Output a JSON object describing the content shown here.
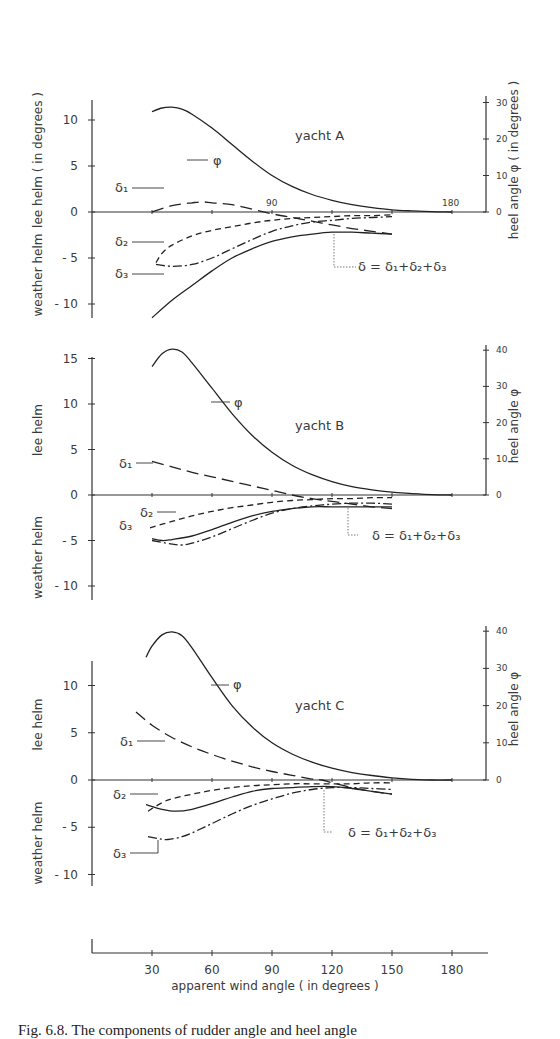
{
  "caption": "Fig. 6.8. The components of rudder angle and heel angle",
  "chart_data": {
    "type": "line",
    "xlabel": "apparent  wind  angle  ( in degrees )",
    "xticks": [
      30,
      60,
      90,
      120,
      150,
      180
    ],
    "xlim": [
      0,
      195
    ],
    "left_axis_label_top": "lee helm",
    "left_axis_label_bottom": "weather helm",
    "left_axis_units": "( in degrees )",
    "right_axis_label": "heel  angle  φ",
    "right_axis_units": "( in degrees )",
    "formula": "δ  =  δ₁+δ₂+δ₃",
    "series_styles": {
      "phi": "solid-thin",
      "delta1": "long-dash",
      "delta2": "short-dash",
      "delta3": "dash-dot",
      "delta": "solid"
    },
    "panels": [
      {
        "name": "yacht  A",
        "yticks": [
          10,
          5,
          0,
          -5,
          -10
        ],
        "ylim": [
          -11.5,
          12
        ],
        "rticks": [
          0,
          10,
          20,
          30
        ],
        "rlim": [
          0,
          30
        ],
        "layout": {
          "y0": 212,
          "pxPerUnit": 9.2,
          "yTop": 100,
          "yBot": 318,
          "rPxPerDeg": 3.65,
          "rTop": 96,
          "titleX": 295,
          "titleY": 140
        },
        "series": [
          {
            "name": "φ",
            "key": "phi",
            "axis": "right",
            "x": [
              30,
              35,
              40,
              45,
              50,
              60,
              70,
              80,
              90,
              100,
              110,
              120,
              130,
              140,
              150,
              160,
              170,
              180
            ],
            "values": [
              27.5,
              28.5,
              28.7,
              28.2,
              26.8,
              23.0,
              18.5,
              14.0,
              10.0,
              7.0,
              4.8,
              3.2,
              2.0,
              1.2,
              0.6,
              0.3,
              0.1,
              0.0
            ]
          },
          {
            "name": "δ₁",
            "key": "delta1",
            "axis": "left",
            "x": [
              30,
              40,
              50,
              55,
              60,
              70,
              80,
              90,
              100,
              110,
              120,
              130,
              140,
              150
            ],
            "values": [
              0.0,
              0.7,
              1.0,
              1.1,
              1.0,
              0.8,
              0.3,
              -0.2,
              -0.6,
              -1.0,
              -1.4,
              -1.8,
              -2.1,
              -2.4
            ]
          },
          {
            "name": "δ₂",
            "key": "delta2",
            "axis": "left",
            "x": [
              32,
              35,
              40,
              50,
              60,
              70,
              80,
              90,
              100,
              110,
              120,
              130,
              140,
              150
            ],
            "values": [
              -5.5,
              -4.5,
              -3.6,
              -2.6,
              -2.0,
              -1.6,
              -1.2,
              -0.9,
              -0.7,
              -0.6,
              -0.5,
              -0.4,
              -0.4,
              -0.3
            ]
          },
          {
            "name": "δ₃",
            "key": "delta3",
            "axis": "left",
            "x": [
              32,
              40,
              50,
              60,
              70,
              80,
              90,
              100,
              110,
              120,
              130,
              140,
              150
            ],
            "values": [
              -5.7,
              -5.9,
              -5.7,
              -5.0,
              -4.0,
              -3.0,
              -2.1,
              -1.5,
              -1.1,
              -0.9,
              -0.7,
              -0.6,
              -0.5
            ]
          },
          {
            "name": "δ",
            "key": "delta",
            "axis": "left",
            "x": [
              30,
              40,
              50,
              60,
              70,
              80,
              90,
              100,
              110,
              120,
              130,
              140,
              150
            ],
            "values": [
              -11.5,
              -9.6,
              -8.0,
              -6.4,
              -5.0,
              -4.0,
              -3.2,
              -2.7,
              -2.4,
              -2.2,
              -2.2,
              -2.3,
              -2.4
            ]
          }
        ],
        "labels": [
          {
            "text": "φ",
            "x": 213,
            "y": 165,
            "leader": [
              [
                187,
                160
              ],
              [
                208,
                160
              ]
            ]
          },
          {
            "text": "δ₁",
            "x": 115,
            "y": 192,
            "leader": [
              [
                132,
                188
              ],
              [
                164,
                188
              ]
            ]
          },
          {
            "text": "δ₂",
            "x": 115,
            "y": 246,
            "leader": [
              [
                132,
                242
              ],
              [
                164,
                242
              ]
            ]
          },
          {
            "text": "δ₃",
            "x": 115,
            "y": 278,
            "leader": [
              [
                132,
                274
              ],
              [
                164,
                274
              ]
            ]
          },
          {
            "text": "90",
            "x": 266,
            "y": 206,
            "leader": []
          },
          {
            "text": "180",
            "x": 442,
            "y": 206,
            "leader": []
          }
        ],
        "formula_pos": {
          "x": 338,
          "y": 271,
          "leader": [
            [
              334,
              234
            ],
            [
              334,
              267
            ],
            [
              356,
              267
            ]
          ]
        }
      },
      {
        "name": "yacht  B",
        "yticks": [
          15,
          10,
          5,
          0,
          -5,
          -10
        ],
        "ylim": [
          -11.5,
          15.5
        ],
        "rticks": [
          0,
          10,
          20,
          30,
          40
        ],
        "rlim": [
          0,
          40
        ],
        "layout": {
          "y0": 495,
          "pxPerUnit": 9.1,
          "yTop": 357,
          "yBot": 600,
          "rPxPerDeg": 3.62,
          "rTop": 345,
          "titleX": 295,
          "titleY": 430
        },
        "series": [
          {
            "name": "φ",
            "key": "phi",
            "axis": "right",
            "x": [
              30,
              35,
              40,
              45,
              50,
              60,
              70,
              80,
              90,
              100,
              110,
              120,
              130,
              140,
              150,
              160,
              170,
              180
            ],
            "values": [
              35.5,
              39.0,
              40.3,
              39.5,
              36.5,
              29.5,
              22.5,
              16.5,
              11.8,
              8.2,
              5.6,
              3.7,
              2.3,
              1.4,
              0.8,
              0.4,
              0.1,
              0.0
            ]
          },
          {
            "name": "δ₁",
            "key": "delta1",
            "axis": "left",
            "x": [
              30,
              40,
              50,
              60,
              70,
              80,
              90,
              100,
              110,
              120,
              130,
              140,
              150
            ],
            "values": [
              3.7,
              3.1,
              2.5,
              2.0,
              1.5,
              1.0,
              0.5,
              0.0,
              -0.4,
              -0.7,
              -1.0,
              -1.3,
              -1.5
            ]
          },
          {
            "name": "δ₂",
            "key": "delta2",
            "axis": "left",
            "x": [
              29,
              40,
              50,
              60,
              70,
              80,
              90,
              100,
              110,
              120,
              130,
              140,
              150
            ],
            "values": [
              -3.6,
              -2.9,
              -2.3,
              -1.8,
              -1.4,
              -1.1,
              -0.8,
              -0.6,
              -0.5,
              -0.4,
              -0.4,
              -0.3,
              -0.3
            ]
          },
          {
            "name": "δ₃",
            "key": "delta3",
            "axis": "left",
            "x": [
              30,
              40,
              45,
              50,
              60,
              70,
              80,
              90,
              100,
              110,
              120,
              130,
              140,
              150
            ],
            "values": [
              -5.0,
              -5.4,
              -5.5,
              -5.3,
              -4.6,
              -3.7,
              -2.8,
              -2.0,
              -1.5,
              -1.2,
              -1.0,
              -0.9,
              -0.9,
              -1.0
            ]
          },
          {
            "name": "δ",
            "key": "delta",
            "axis": "left",
            "x": [
              30,
              35,
              40,
              50,
              60,
              70,
              80,
              90,
              100,
              110,
              120,
              130,
              140,
              150
            ],
            "values": [
              -4.8,
              -5.0,
              -4.9,
              -4.5,
              -3.8,
              -3.0,
              -2.3,
              -1.8,
              -1.5,
              -1.3,
              -1.3,
              -1.3,
              -1.3,
              -1.3
            ]
          }
        ],
        "labels": [
          {
            "text": "φ",
            "x": 234,
            "y": 407,
            "leader": [
              [
                211,
                402
              ],
              [
                230,
                402
              ]
            ]
          },
          {
            "text": "δ₁",
            "x": 119,
            "y": 468,
            "leader": [
              [
                136,
                463
              ],
              [
                153,
                463
              ]
            ]
          },
          {
            "text": "δ₂",
            "x": 140,
            "y": 517,
            "leader": [
              [
                157,
                512
              ],
              [
                176,
                512
              ]
            ]
          },
          {
            "text": "δ₃",
            "x": 119,
            "y": 530,
            "leader": []
          }
        ],
        "formula_pos": {
          "x": 352,
          "y": 540,
          "leader": [
            [
              348,
              508
            ],
            [
              348,
              535
            ],
            [
              358,
              535
            ]
          ]
        }
      },
      {
        "name": "yacht  C",
        "yticks": [
          10,
          5,
          0,
          -5,
          -10
        ],
        "ylim": [
          -11,
          12.5
        ],
        "rticks": [
          0,
          10,
          20,
          30,
          40
        ],
        "rlim": [
          0,
          40
        ],
        "layout": {
          "y0": 780,
          "pxPerUnit": 9.45,
          "yTop": 661,
          "yBot": 886,
          "rPxPerDeg": 3.72,
          "rTop": 626,
          "titleX": 295,
          "titleY": 710
        },
        "series": [
          {
            "name": "φ",
            "key": "phi",
            "axis": "right",
            "x": [
              27,
              30,
              35,
              40,
              45,
              50,
              60,
              70,
              80,
              90,
              100,
              110,
              120,
              130,
              140,
              150,
              160,
              170,
              180
            ],
            "values": [
              33.0,
              36.0,
              39.0,
              39.8,
              38.8,
              35.5,
              27.5,
              20.0,
              14.3,
              10.0,
              7.0,
              4.8,
              3.2,
              2.0,
              1.2,
              0.6,
              0.2,
              0.0,
              0.0
            ]
          },
          {
            "name": "δ₁",
            "key": "delta1",
            "axis": "left",
            "x": [
              22,
              30,
              40,
              50,
              60,
              70,
              80,
              90,
              100,
              110,
              115,
              120,
              130,
              140,
              150
            ],
            "values": [
              7.2,
              5.8,
              4.5,
              3.5,
              2.7,
              2.0,
              1.4,
              0.9,
              0.5,
              0.1,
              0.0,
              -0.3,
              -0.8,
              -1.2,
              -1.5
            ]
          },
          {
            "name": "δ₂",
            "key": "delta2",
            "axis": "left",
            "x": [
              28,
              35,
              40,
              50,
              60,
              70,
              80,
              90,
              100,
              110,
              120,
              130,
              140,
              150
            ],
            "values": [
              -3.3,
              -2.4,
              -2.0,
              -1.5,
              -1.1,
              -0.8,
              -0.6,
              -0.5,
              -0.4,
              -0.4,
              -0.4,
              -0.4,
              -0.3,
              -0.3
            ]
          },
          {
            "name": "δ₃",
            "key": "delta3",
            "axis": "left",
            "x": [
              28,
              33,
              38,
              45,
              50,
              60,
              70,
              80,
              90,
              100,
              110,
              120,
              130,
              140,
              150
            ],
            "values": [
              -6.0,
              -6.2,
              -6.3,
              -6.0,
              -5.6,
              -4.6,
              -3.6,
              -2.7,
              -2.0,
              -1.4,
              -1.0,
              -0.8,
              -0.8,
              -0.9,
              -1.0
            ]
          },
          {
            "name": "δ",
            "key": "delta",
            "axis": "left",
            "x": [
              27,
              35,
              42,
              50,
              60,
              70,
              80,
              90,
              100,
              110,
              120,
              130,
              140,
              150
            ],
            "values": [
              -2.6,
              -3.1,
              -3.3,
              -3.1,
              -2.5,
              -1.8,
              -1.2,
              -0.9,
              -0.8,
              -0.7,
              -0.7,
              -0.9,
              -1.2,
              -1.5
            ]
          }
        ],
        "labels": [
          {
            "text": "φ",
            "x": 233,
            "y": 689,
            "leader": [
              [
                211,
                685
              ],
              [
                229,
                685
              ]
            ]
          },
          {
            "text": "δ₁",
            "x": 120,
            "y": 746,
            "leader": [
              [
                137,
                741
              ],
              [
                165,
                741
              ]
            ]
          },
          {
            "text": "δ₂",
            "x": 113,
            "y": 799,
            "leader": [
              [
                130,
                794
              ],
              [
                158,
                794
              ]
            ]
          },
          {
            "text": "δ₃",
            "x": 113,
            "y": 858,
            "leader": [
              [
                130,
                853
              ],
              [
                158,
                853
              ],
              [
                158,
                840
              ]
            ]
          }
        ],
        "formula_pos": {
          "x": 328,
          "y": 837,
          "leader": [
            [
              324,
              790
            ],
            [
              324,
              832
            ],
            [
              332,
              832
            ]
          ]
        }
      }
    ],
    "bottom_axis": {
      "y": 953,
      "x0": 92,
      "pxPerDeg": 2.0,
      "xEnd": 488
    }
  }
}
